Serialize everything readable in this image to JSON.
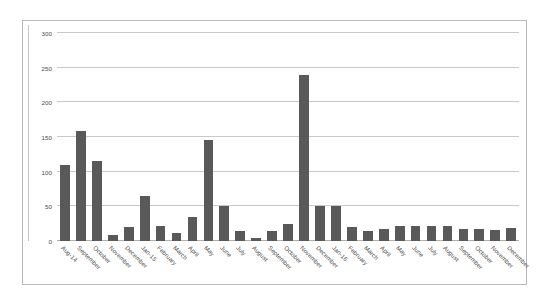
{
  "chart_data": {
    "type": "bar",
    "title": "",
    "xlabel": "",
    "ylabel": "",
    "ylim": [
      0,
      300
    ],
    "yticks": [
      0,
      50,
      100,
      150,
      200,
      250,
      300
    ],
    "ytick_labels": [
      "0",
      "50",
      "100",
      "150",
      "200",
      "250",
      "300"
    ],
    "grid": true,
    "legend": false,
    "bar_color": "#595959",
    "gridline_color": "#c8c8c8",
    "axis_color": "#b0b0b0",
    "frame_border_color": "#b9b9b9",
    "background": "#ffffff",
    "categories": [
      "Aug-14",
      "September",
      "October",
      "November",
      "December",
      "Jan-15",
      "February",
      "March",
      "April",
      "May",
      "June",
      "July",
      "August",
      "September",
      "October",
      "November",
      "December",
      "Jan-16",
      "February",
      "March",
      "April",
      "May",
      "June",
      "July",
      "August",
      "September",
      "October",
      "November",
      "December"
    ],
    "values": [
      110,
      159,
      115,
      9,
      20,
      65,
      22,
      11,
      34,
      146,
      50,
      14,
      5,
      14,
      24,
      239,
      50,
      51,
      20,
      15,
      18,
      22,
      22,
      22,
      22,
      17,
      17,
      16,
      19
    ]
  }
}
